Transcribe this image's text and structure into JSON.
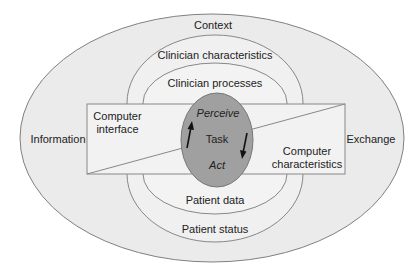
{
  "diagram": {
    "outer": {
      "label": "Context"
    },
    "left_label": "Information",
    "right_label": "Exchange",
    "top_rings": [
      {
        "label": "Clinician characteristics"
      },
      {
        "label": "Clinician processes"
      }
    ],
    "bottom_rings": [
      {
        "label": "Patient data"
      },
      {
        "label": "Patient status"
      }
    ],
    "box": {
      "left_label_line1": "Computer",
      "left_label_line2": "interface",
      "right_label_line1": "Computer",
      "right_label_line2": "characteristics"
    },
    "center": {
      "top": "Perceive",
      "middle": "Task",
      "bottom": "Act"
    },
    "colors": {
      "background": "#ffffff",
      "outer_fill": "#ebebeb",
      "ring_fill": "#f0f0f0",
      "box_fill": "#f2f2f2",
      "center_fill": "#9e9e9e",
      "stroke": "#777777"
    }
  }
}
